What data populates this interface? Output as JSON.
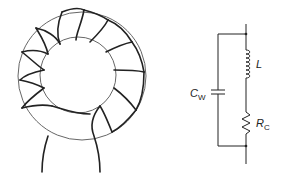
{
  "figure": {
    "left": {
      "name": "Toroidal core with winding",
      "turns": 12
    },
    "right": {
      "name": "Equivalent circuit",
      "components": [
        {
          "id": "L",
          "label": "L",
          "subscript": "",
          "type": "inductor"
        },
        {
          "id": "RC",
          "label": "R",
          "subscript": "C",
          "type": "resistor"
        },
        {
          "id": "CW",
          "label": "C",
          "subscript": "W",
          "type": "capacitor"
        }
      ]
    }
  },
  "labels": {
    "L": "L",
    "R": "R",
    "R_sub": "C",
    "C": "C",
    "C_sub": "W"
  },
  "colors": {
    "line": "#222222",
    "core": "#555555"
  }
}
